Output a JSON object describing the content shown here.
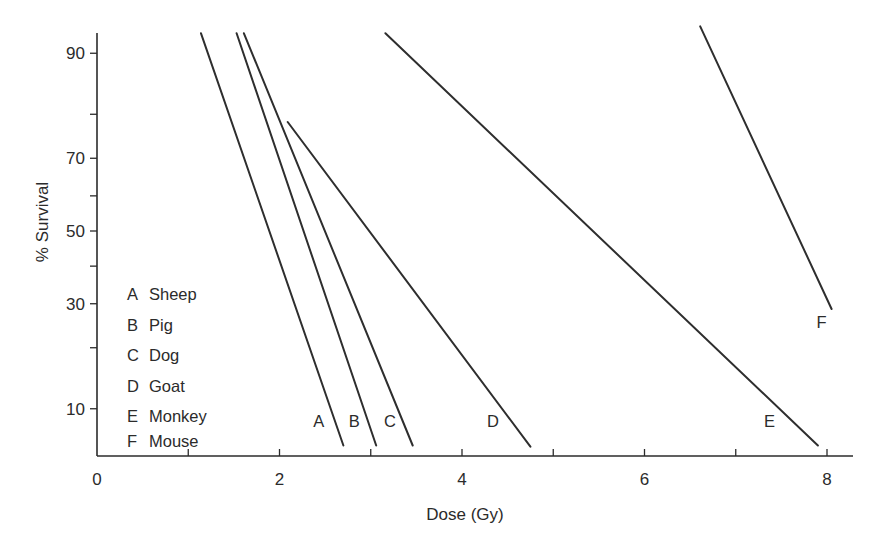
{
  "chart_data": {
    "type": "line",
    "title": "",
    "xlabel": "Dose (Gy)",
    "ylabel": "% Survival",
    "xlim": [
      0,
      8.3
    ],
    "ylim_percent": [
      4.5,
      95.2
    ],
    "y_scale": "probit",
    "grid": false,
    "x_ticks": [
      0,
      1,
      2,
      3,
      4,
      5,
      6,
      7,
      8
    ],
    "x_tick_labels": [
      "0",
      "",
      "2",
      "",
      "4",
      "",
      "6",
      "",
      "8"
    ],
    "y_ticks": [
      10,
      20,
      30,
      40,
      50,
      60,
      70,
      80,
      90
    ],
    "y_tick_labels": [
      "10",
      "",
      "30",
      "",
      "50",
      "",
      "70",
      "",
      "90"
    ],
    "legend": {
      "placement": "bottom-left",
      "entries": [
        {
          "key": "A",
          "label": "Sheep"
        },
        {
          "key": "B",
          "label": "Pig"
        },
        {
          "key": "C",
          "label": "Dog"
        },
        {
          "key": "D",
          "label": "Goat"
        },
        {
          "key": "E",
          "label": "Monkey"
        },
        {
          "key": "F",
          "label": "Mouse"
        }
      ]
    },
    "series": [
      {
        "name": "A",
        "animal": "Sheep",
        "x": [
          1.14,
          2.7
        ],
        "y": [
          92.3,
          6.1
        ],
        "label_at": {
          "x": 2.43,
          "y": 8.5
        }
      },
      {
        "name": "B",
        "animal": "Pig",
        "x": [
          1.53,
          3.06
        ],
        "y": [
          92.3,
          6.1
        ],
        "label_at": {
          "x": 2.82,
          "y": 8.5
        }
      },
      {
        "name": "C",
        "animal": "Dog",
        "x": [
          1.61,
          3.46
        ],
        "y": [
          92.3,
          6.1
        ],
        "label_at": {
          "x": 3.21,
          "y": 8.5
        }
      },
      {
        "name": "D",
        "animal": "Goat",
        "x": [
          2.09,
          4.75
        ],
        "y": [
          78.4,
          6.0
        ],
        "label_at": {
          "x": 4.34,
          "y": 8.5
        }
      },
      {
        "name": "E",
        "animal": "Monkey",
        "x": [
          3.16,
          7.9
        ],
        "y": [
          92.3,
          6.1
        ],
        "label_at": {
          "x": 7.37,
          "y": 8.5
        }
      },
      {
        "name": "F",
        "animal": "Mouse",
        "x": [
          6.61,
          8.05
        ],
        "y": [
          93.0,
          28.7
        ],
        "label_at": {
          "x": 7.94,
          "y": 25.5
        }
      }
    ]
  }
}
